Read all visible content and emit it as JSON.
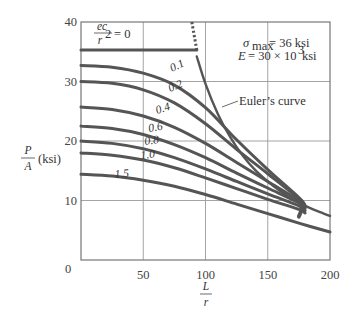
{
  "chart_data": {
    "type": "line",
    "title": "",
    "xlabel_num": "L",
    "xlabel_den": "r",
    "ylabel_num": "P",
    "ylabel_den": "A",
    "ylabel_unit": "(ksi)",
    "xlim": [
      0,
      200
    ],
    "ylim": [
      0,
      40
    ],
    "xticks": [
      "0",
      "50",
      "100",
      "150",
      "200"
    ],
    "yticks": [
      "10",
      "20",
      "30",
      "40"
    ],
    "grid": true,
    "annotations": {
      "sigma_label": "σ",
      "sigma_sub": "max",
      "sigma_value": "= 36 ksi",
      "e_label": "E",
      "e_value": "= 30 × 10",
      "e_exp": "3",
      "e_unit": " ksi",
      "euler_label": "Euler’s curve",
      "ecr_num": "ec",
      "ecr_den": "r",
      "ecr_exp": "2",
      "ecr_value": "= 0"
    },
    "series": [
      {
        "name": "ec/r² = 0",
        "label": "",
        "x": [
          0,
          93
        ],
        "values": [
          35.3,
          35.3
        ]
      },
      {
        "name": "ec/r² = 0.1",
        "label": "0.1",
        "x": [
          0,
          25,
          50,
          75,
          100,
          125,
          150,
          175,
          180
        ],
        "values": [
          32.7,
          32.4,
          31.4,
          29.4,
          25.6,
          20.2,
          15.2,
          10.5,
          9.2
        ]
      },
      {
        "name": "ec/r² = 0.2",
        "label": "0.2",
        "x": [
          0,
          25,
          50,
          75,
          100,
          125,
          150,
          175,
          180
        ],
        "values": [
          30.0,
          29.7,
          28.6,
          26.4,
          22.9,
          18.6,
          14.5,
          10.3,
          9.0
        ]
      },
      {
        "name": "ec/r² = 0.4",
        "label": "0.4",
        "x": [
          0,
          25,
          50,
          75,
          100,
          125,
          150,
          175,
          180
        ],
        "values": [
          25.7,
          25.3,
          24.2,
          22.3,
          19.6,
          16.4,
          13.2,
          10.0,
          8.8
        ]
      },
      {
        "name": "ec/r² = 0.6",
        "label": "0.6",
        "x": [
          0,
          25,
          50,
          75,
          100,
          125,
          150,
          175,
          180
        ],
        "values": [
          22.5,
          22.1,
          21.1,
          19.4,
          17.2,
          14.6,
          12.1,
          9.6,
          8.6
        ]
      },
      {
        "name": "ec/r² = 0.8",
        "label": "0.8",
        "x": [
          0,
          25,
          50,
          75,
          100,
          125,
          150,
          175,
          180
        ],
        "values": [
          20.0,
          19.6,
          18.7,
          17.2,
          15.3,
          13.2,
          11.1,
          9.1,
          8.3
        ]
      },
      {
        "name": "ec/r² = 1.0",
        "label": "1.0",
        "x": [
          0,
          25,
          50,
          75,
          100,
          125,
          150,
          175,
          180
        ],
        "values": [
          18.0,
          17.6,
          16.8,
          15.5,
          13.8,
          12.0,
          10.2,
          8.5,
          7.9
        ]
      },
      {
        "name": "ec/r² = 1.5",
        "label": "1.5",
        "x": [
          0,
          25,
          50,
          75,
          100,
          125,
          150,
          175,
          200
        ],
        "values": [
          14.4,
          14.1,
          13.4,
          12.4,
          11.0,
          9.4,
          7.8,
          6.2,
          4.7
        ]
      },
      {
        "name": "Euler's curve",
        "label": "Euler’s curve",
        "x": [
          93,
          100,
          110,
          120,
          130,
          140,
          150,
          160,
          170,
          180,
          190,
          200
        ],
        "values": [
          34.2,
          29.6,
          24.5,
          20.6,
          17.5,
          15.1,
          13.2,
          11.6,
          10.2,
          9.1,
          8.2,
          7.4
        ]
      },
      {
        "name": "Euler's curve (dotted, above σmax)",
        "label": "",
        "x": [
          89,
          93
        ],
        "values": [
          40,
          35.3
        ],
        "style": "dotted"
      }
    ],
    "legend": "inline curve labels"
  }
}
